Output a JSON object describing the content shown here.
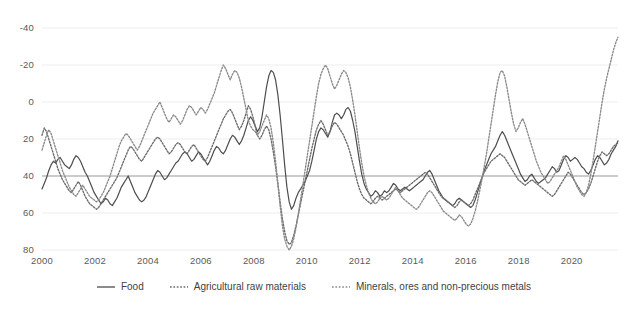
{
  "chart_data": {
    "type": "line",
    "title": "",
    "xlabel": "",
    "ylabel": "",
    "xlim": [
      2000,
      2021.75
    ],
    "ylim": [
      -40,
      80
    ],
    "y_ticks": [
      -40,
      -20,
      0,
      20,
      40,
      60,
      80
    ],
    "x_ticks": [
      2000,
      2002,
      2004,
      2006,
      2008,
      2010,
      2012,
      2014,
      2016,
      2018,
      2020
    ],
    "grid": "horizontal-faint",
    "zero_line": 0,
    "legend_position": "bottom-center",
    "colors": {
      "food": "#4d4d4d",
      "agricultural_raw_materials": "#6b6b6b",
      "minerals_ores": "#8a8a8a",
      "zero_line": "#9a9a9a",
      "grid": "#ededed",
      "text": "#5a5a5a"
    },
    "series": [
      {
        "name": "Food",
        "style": "solid",
        "values": [
          -7,
          -4,
          -1,
          3,
          6,
          8,
          7,
          9,
          10,
          8,
          6,
          5,
          4,
          6,
          9,
          11,
          10,
          8,
          5,
          2,
          0,
          -3,
          -6,
          -9,
          -11,
          -13,
          -15,
          -14,
          -12,
          -13,
          -15,
          -16,
          -14,
          -12,
          -9,
          -6,
          -4,
          -2,
          0,
          -3,
          -6,
          -9,
          -11,
          -13,
          -14,
          -13,
          -11,
          -8,
          -5,
          -2,
          1,
          3,
          2,
          0,
          -2,
          -1,
          1,
          3,
          5,
          7,
          8,
          10,
          12,
          13,
          12,
          10,
          8,
          9,
          11,
          13,
          12,
          10,
          8,
          6,
          8,
          11,
          14,
          16,
          15,
          13,
          12,
          14,
          17,
          20,
          22,
          21,
          19,
          17,
          19,
          22,
          26,
          30,
          32,
          30,
          27,
          24,
          26,
          32,
          40,
          48,
          54,
          57,
          56,
          52,
          44,
          33,
          20,
          6,
          -6,
          -14,
          -18,
          -16,
          -12,
          -9,
          -7,
          -5,
          -3,
          0,
          3,
          8,
          14,
          20,
          24,
          26,
          25,
          23,
          21,
          24,
          29,
          33,
          34,
          33,
          31,
          33,
          36,
          37,
          35,
          30,
          24,
          16,
          8,
          1,
          -4,
          -7,
          -9,
          -11,
          -10,
          -8,
          -9,
          -11,
          -10,
          -8,
          -9,
          -8,
          -6,
          -4,
          -5,
          -7,
          -8,
          -7,
          -6,
          -7,
          -8,
          -7,
          -6,
          -5,
          -4,
          -3,
          -2,
          0,
          2,
          3,
          1,
          -2,
          -5,
          -8,
          -10,
          -12,
          -13,
          -14,
          -15,
          -16,
          -15,
          -13,
          -12,
          -13,
          -14,
          -15,
          -16,
          -17,
          -16,
          -13,
          -9,
          -5,
          -1,
          3,
          6,
          9,
          12,
          14,
          16,
          19,
          22,
          24,
          22,
          19,
          16,
          13,
          10,
          7,
          4,
          1,
          -1,
          -3,
          -2,
          0,
          1,
          -1,
          -3,
          -4,
          -3,
          -2,
          -1,
          1,
          3,
          5,
          4,
          2,
          3,
          6,
          9,
          11,
          10,
          8,
          9,
          10,
          9,
          7,
          5,
          4,
          2,
          1,
          3,
          6,
          9,
          11,
          10,
          8,
          6,
          7,
          9,
          12,
          14,
          16,
          19
        ]
      },
      {
        "name": "Agricultural raw materials",
        "style": "dotted",
        "values": [
          22,
          26,
          24,
          20,
          16,
          12,
          8,
          4,
          1,
          -2,
          -4,
          -6,
          -8,
          -9,
          -7,
          -5,
          -3,
          -5,
          -8,
          -11,
          -13,
          -15,
          -16,
          -17,
          -18,
          -17,
          -15,
          -13,
          -11,
          -9,
          -7,
          -5,
          -3,
          -1,
          2,
          5,
          8,
          11,
          14,
          16,
          15,
          13,
          11,
          9,
          8,
          10,
          12,
          14,
          16,
          18,
          20,
          21,
          20,
          18,
          16,
          14,
          12,
          13,
          15,
          17,
          18,
          17,
          15,
          13,
          12,
          14,
          16,
          17,
          15,
          13,
          11,
          9,
          8,
          10,
          13,
          16,
          19,
          22,
          25,
          28,
          31,
          33,
          35,
          36,
          34,
          31,
          28,
          25,
          27,
          30,
          34,
          38,
          36,
          32,
          27,
          22,
          20,
          22,
          25,
          27,
          25,
          20,
          13,
          5,
          -4,
          -14,
          -23,
          -30,
          -35,
          -37,
          -36,
          -32,
          -27,
          -21,
          -15,
          -9,
          -3,
          3,
          9,
          15,
          20,
          25,
          28,
          30,
          28,
          25,
          22,
          24,
          27,
          29,
          28,
          26,
          24,
          22,
          19,
          16,
          12,
          7,
          2,
          -3,
          -7,
          -10,
          -12,
          -13,
          -14,
          -15,
          -14,
          -12,
          -11,
          -12,
          -13,
          -12,
          -11,
          -10,
          -9,
          -8,
          -7,
          -8,
          -9,
          -8,
          -7,
          -6,
          -5,
          -4,
          -3,
          -2,
          -1,
          0,
          1,
          2,
          1,
          -1,
          -3,
          -5,
          -7,
          -9,
          -11,
          -12,
          -13,
          -14,
          -15,
          -16,
          -17,
          -16,
          -14,
          -13,
          -14,
          -15,
          -16,
          -15,
          -13,
          -10,
          -7,
          -4,
          -1,
          2,
          4,
          6,
          8,
          9,
          10,
          11,
          12,
          11,
          10,
          8,
          6,
          4,
          2,
          0,
          -2,
          -3,
          -4,
          -5,
          -4,
          -3,
          -2,
          -3,
          -4,
          -5,
          -6,
          -7,
          -8,
          -9,
          -10,
          -11,
          -10,
          -8,
          -6,
          -4,
          -2,
          0,
          2,
          1,
          -1,
          -3,
          -5,
          -7,
          -9,
          -10,
          -9,
          -7,
          -4,
          0,
          4,
          8,
          11,
          13,
          12,
          11,
          12,
          14,
          16,
          17,
          18
        ]
      },
      {
        "name": "Minerals, ores and non-precious metals",
        "style": "dotted",
        "values": [
          14,
          18,
          22,
          25,
          23,
          19,
          15,
          11,
          7,
          3,
          0,
          -3,
          -6,
          -8,
          -10,
          -11,
          -9,
          -7,
          -5,
          -7,
          -9,
          -11,
          -12,
          -13,
          -14,
          -13,
          -11,
          -9,
          -6,
          -3,
          0,
          4,
          8,
          12,
          16,
          19,
          21,
          23,
          22,
          20,
          18,
          16,
          14,
          16,
          19,
          22,
          25,
          28,
          31,
          34,
          36,
          38,
          40,
          37,
          34,
          31,
          29,
          31,
          33,
          32,
          30,
          28,
          30,
          33,
          36,
          38,
          37,
          35,
          33,
          35,
          37,
          36,
          34,
          36,
          39,
          42,
          45,
          49,
          53,
          57,
          60,
          58,
          55,
          52,
          55,
          57,
          56,
          53,
          48,
          42,
          36,
          30,
          27,
          25,
          24,
          22,
          24,
          27,
          30,
          33,
          31,
          26,
          18,
          8,
          -4,
          -16,
          -27,
          -34,
          -38,
          -40,
          -38,
          -34,
          -28,
          -21,
          -13,
          -5,
          3,
          11,
          19,
          27,
          35,
          43,
          50,
          55,
          58,
          60,
          58,
          54,
          50,
          47,
          49,
          52,
          55,
          57,
          56,
          53,
          48,
          41,
          33,
          24,
          15,
          7,
          0,
          -5,
          -9,
          -12,
          -14,
          -15,
          -14,
          -12,
          -11,
          -12,
          -13,
          -12,
          -10,
          -8,
          -6,
          -8,
          -10,
          -12,
          -13,
          -14,
          -15,
          -16,
          -17,
          -18,
          -17,
          -15,
          -13,
          -11,
          -9,
          -8,
          -9,
          -11,
          -13,
          -15,
          -17,
          -19,
          -20,
          -21,
          -22,
          -23,
          -24,
          -23,
          -21,
          -22,
          -24,
          -26,
          -27,
          -26,
          -23,
          -19,
          -14,
          -8,
          -2,
          5,
          12,
          20,
          28,
          36,
          44,
          51,
          56,
          57,
          54,
          48,
          41,
          34,
          28,
          24,
          26,
          29,
          31,
          28,
          24,
          20,
          16,
          12,
          8,
          5,
          2,
          0,
          -2,
          -4,
          -3,
          -1,
          1,
          3,
          5,
          8,
          11,
          9,
          6,
          3,
          0,
          -3,
          -6,
          -8,
          -10,
          -11,
          -9,
          -5,
          1,
          8,
          16,
          24,
          32,
          40,
          47,
          53,
          58,
          63,
          68,
          72,
          75
        ]
      }
    ]
  },
  "axis": {
    "y_tick_labels": [
      "80",
      "60",
      "40",
      "20",
      "0",
      "-20",
      "-40"
    ],
    "x_tick_labels": [
      "2000",
      "2002",
      "2004",
      "2006",
      "2008",
      "2010",
      "2012",
      "2014",
      "2016",
      "2018",
      "2020"
    ]
  },
  "legend": {
    "items": [
      {
        "label": "Food",
        "style": "solid"
      },
      {
        "label": "Agricultural raw materials",
        "style": "dotted"
      },
      {
        "label": "Minerals, ores and non-precious metals",
        "style": "dotted"
      }
    ]
  }
}
